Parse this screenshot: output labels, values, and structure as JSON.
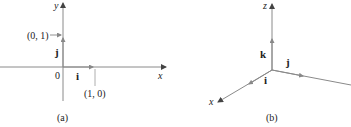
{
  "panel_a": {
    "caption": "(a)",
    "x_axis_label": "x",
    "y_axis_label": "y",
    "origin_label": "0",
    "i_label": "i",
    "j_label": "j",
    "point_x_label": "(1, 0)",
    "point_y_label": "(0, 1)"
  },
  "panel_b": {
    "caption": "(b)",
    "x_axis_label": "x",
    "z_axis_label": "z",
    "i_label": "i",
    "j_label": "j",
    "k_label": "k"
  },
  "colors": {
    "axis": "#8a8a8a",
    "text": "#222222"
  }
}
